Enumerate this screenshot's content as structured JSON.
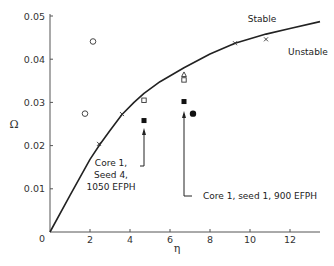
{
  "chart_data": {
    "type": "scatter",
    "title": "",
    "xlabel": "η",
    "ylabel": "Ω",
    "xlim": [
      0,
      13.5
    ],
    "ylim": [
      0,
      0.05
    ],
    "grid": false,
    "legend": null,
    "x_ticks": [
      0,
      2,
      4,
      6,
      8,
      10,
      12
    ],
    "x_tick_labels": [
      "0",
      "2",
      "4",
      "6",
      "8",
      "10",
      "12"
    ],
    "y_ticks": [
      0.01,
      0.02,
      0.03,
      0.04,
      0.05
    ],
    "y_tick_labels": [
      "0.01",
      "0.02",
      "0.03",
      "0.04",
      "0.05"
    ],
    "origin_label": "0",
    "boundary_curve": {
      "name": "Stability boundary",
      "x": [
        0,
        1,
        2,
        2.5,
        3,
        3.6,
        4.2,
        4.7,
        5.5,
        6.7,
        8,
        9.25,
        10.8,
        12,
        13.5
      ],
      "y": [
        0,
        0.0085,
        0.0168,
        0.0203,
        0.0235,
        0.0272,
        0.03,
        0.0321,
        0.0348,
        0.038,
        0.0412,
        0.0437,
        0.0458,
        0.0471,
        0.0487
      ]
    },
    "region_labels": [
      {
        "text": "Stable",
        "x": 10.6,
        "y": 0.0483
      },
      {
        "text": "Unstable",
        "x": 11.4,
        "y": 0.0438
      }
    ],
    "series": [
      {
        "name": "open circle",
        "marker": "circle-open",
        "points": [
          [
            2.15,
            0.0441
          ],
          [
            1.75,
            0.0274
          ]
        ]
      },
      {
        "name": "cross",
        "marker": "x",
        "points": [
          [
            2.45,
            0.0204
          ],
          [
            3.6,
            0.0273
          ],
          [
            9.25,
            0.0437
          ],
          [
            10.8,
            0.0446
          ]
        ]
      },
      {
        "name": "open square",
        "marker": "square-open",
        "points": [
          [
            4.7,
            0.0305
          ],
          [
            6.7,
            0.0352
          ]
        ]
      },
      {
        "name": "open triangle",
        "marker": "triangle-open",
        "points": [
          [
            6.7,
            0.0364
          ]
        ]
      },
      {
        "name": "filled square",
        "marker": "square-filled",
        "points": [
          [
            4.7,
            0.0258
          ],
          [
            6.7,
            0.0302
          ]
        ]
      },
      {
        "name": "filled circle",
        "marker": "circle-filled",
        "points": [
          [
            7.15,
            0.0274
          ]
        ]
      }
    ],
    "annotations": [
      {
        "lines": [
          "Core 1,",
          "Seed 4,",
          "1050 EFPH"
        ],
        "points_to": [
          4.7,
          0.0258
        ]
      },
      {
        "lines": [
          "Core 1, seed 1, 900 EFPH"
        ],
        "points_to": [
          6.7,
          0.0302
        ]
      }
    ]
  }
}
